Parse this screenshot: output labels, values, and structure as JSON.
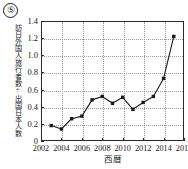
{
  "figure": {
    "number_label": "⑤"
  },
  "chart_data": {
    "type": "line",
    "title": "",
    "xlabel": "西暦",
    "ylabel": "訪日外国人旅行者数÷出国日本人数",
    "x": [
      2003,
      2004,
      2005,
      2006,
      2007,
      2008,
      2009,
      2010,
      2011,
      2012,
      2013,
      2014,
      2015
    ],
    "values": [
      0.18,
      0.14,
      0.26,
      0.29,
      0.48,
      0.52,
      0.44,
      0.51,
      0.37,
      0.45,
      0.52,
      0.73,
      1.22
    ],
    "xlim": [
      2002,
      2016
    ],
    "ylim": [
      0,
      1.4
    ],
    "xticks": [
      2002,
      2004,
      2006,
      2008,
      2010,
      2012,
      2014,
      2016
    ],
    "xtick_labels": [
      "2002",
      "2004",
      "2006",
      "2008",
      "2010",
      "2012",
      "2014",
      "2016"
    ],
    "yticks": [
      0,
      0.2,
      0.4,
      0.6,
      0.8,
      1.0,
      1.2,
      1.4
    ],
    "ytick_labels": [
      "0",
      "0.2",
      "0.4",
      "0.6",
      "0.8",
      "1.0",
      "1.2",
      "1.4"
    ],
    "grid": true,
    "legend": null,
    "marker": "square",
    "line_color": "#1a1a1a",
    "marker_color": "#1a1a1a",
    "grid_color": "#9a9a9a"
  }
}
